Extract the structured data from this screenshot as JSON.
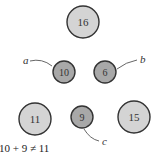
{
  "colors": {
    "large_fill": "#d4d4d4",
    "small_fill": "#a8a8a8",
    "stroke": "#333333",
    "connector": "#555555"
  },
  "nodes": [
    {
      "id": "n16",
      "value": "16",
      "size": "large"
    },
    {
      "id": "n10",
      "value": "10",
      "size": "small"
    },
    {
      "id": "n6",
      "value": "6",
      "size": "small"
    },
    {
      "id": "n11",
      "value": "11",
      "size": "large"
    },
    {
      "id": "n9",
      "value": "9",
      "size": "small"
    },
    {
      "id": "n15",
      "value": "15",
      "size": "large"
    }
  ],
  "labels": {
    "a": "a",
    "b": "b",
    "c": "c"
  },
  "equation": "10 + 9 ≠ 11"
}
